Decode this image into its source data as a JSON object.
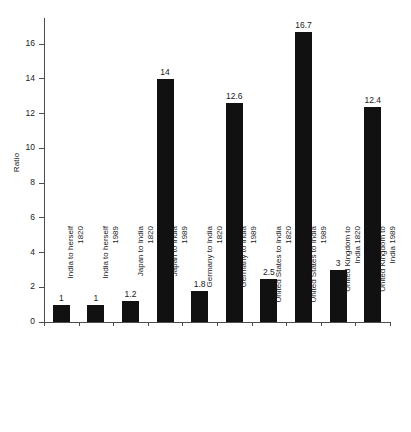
{
  "chart_data": {
    "type": "bar",
    "title": "",
    "xlabel": "",
    "ylabel": "Ratio",
    "ylim": [
      0,
      17.5
    ],
    "yticks": [
      0,
      2,
      4,
      6,
      8,
      10,
      12,
      14,
      16
    ],
    "grid": false,
    "legend": null,
    "bar_color": "#111111",
    "axis_color": "#4d4d4d",
    "background": "#ffffff",
    "categories": [
      "India to herself 1820",
      "India to herself 1989",
      "Japan to India 1820",
      "Japan to India 1989",
      "Germany to India 1820",
      "Germany to India 1989",
      "United States to India 1820",
      "United States to India 1989",
      "United Kingdom to India 1820",
      "United Kingdom to India 1989"
    ],
    "category_lines": [
      {
        "line1": "India to herself",
        "line2": "1820"
      },
      {
        "line1": "India to herself",
        "line2": "1989"
      },
      {
        "line1": "Japan to India",
        "line2": "1820"
      },
      {
        "line1": "Japan to India",
        "line2": "1989"
      },
      {
        "line1": "Germany to India",
        "line2": "1820"
      },
      {
        "line1": "Germany to India",
        "line2": "1989"
      },
      {
        "line1": "United States to India",
        "line2": "1820"
      },
      {
        "line1": "United States to India",
        "line2": "1989"
      },
      {
        "line1": "United Kingdom to",
        "line2": "India 1820"
      },
      {
        "line1": "United Kingdom to",
        "line2": "India 1989"
      }
    ],
    "values": [
      1,
      1,
      1.2,
      14,
      1.8,
      12.6,
      2.5,
      16.7,
      3,
      12.4
    ],
    "value_labels": [
      "1",
      "1",
      "1.2",
      "14",
      "1.8",
      "12.6",
      "2.5",
      "16.7",
      "3",
      "12.4"
    ]
  },
  "axis": {
    "ytick_labels": [
      "0",
      "2",
      "4",
      "6",
      "8",
      "10",
      "12",
      "14",
      "16"
    ],
    "y_title": "Ratio"
  }
}
